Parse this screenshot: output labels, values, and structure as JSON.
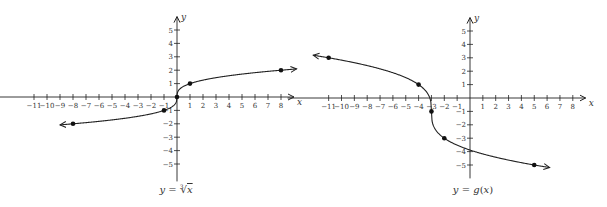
{
  "chart_data": [
    {
      "type": "line",
      "title": "",
      "caption": "y = ∛x",
      "caption_parts": {
        "lhs": "y",
        "eq": " = ",
        "root_index": "3",
        "radicand": "x"
      },
      "xlabel": "x",
      "ylabel": "y",
      "xlim": [
        -11,
        8
      ],
      "ylim": [
        -5,
        5
      ],
      "x_ticks": [
        -11,
        -10,
        -9,
        -8,
        -7,
        -6,
        -5,
        -4,
        -3,
        -2,
        -1,
        1,
        2,
        3,
        4,
        5,
        6,
        7,
        8
      ],
      "x_tick_labels": [
        "−11",
        "−10",
        "−9",
        "−8",
        "−7",
        "−6",
        "−5",
        "−4",
        "−3",
        "−2",
        "−1",
        "1",
        "2",
        "3",
        "4",
        "5",
        "6",
        "7",
        "8"
      ],
      "y_ticks": [
        -5,
        -4,
        -3,
        -2,
        -1,
        1,
        2,
        3,
        4,
        5
      ],
      "y_tick_labels": [
        "−5",
        "−4",
        "−3",
        "−2",
        "−1",
        "1",
        "2",
        "3",
        "4",
        "5"
      ],
      "grid": false,
      "series": [
        {
          "name": "y = ∛x",
          "function": "cbrt(x)",
          "domain_drawn": [
            -9,
            9.2
          ],
          "arrows": "both",
          "points": [
            {
              "x": -8,
              "y": -2
            },
            {
              "x": -1,
              "y": -1
            },
            {
              "x": 0,
              "y": 0
            },
            {
              "x": 1,
              "y": 1
            },
            {
              "x": 8,
              "y": 2
            }
          ]
        }
      ]
    },
    {
      "type": "line",
      "title": "",
      "caption": "y = g(x)",
      "caption_parts": {
        "lhs": "y",
        "eq": " = ",
        "fn": "g",
        "arg": "x"
      },
      "xlabel": "x",
      "ylabel": "y",
      "xlim": [
        -11,
        8
      ],
      "ylim": [
        -5,
        5
      ],
      "x_ticks": [
        -11,
        -10,
        -9,
        -8,
        -7,
        -6,
        -5,
        -4,
        -3,
        -2,
        -1,
        1,
        2,
        3,
        4,
        5,
        6,
        7,
        8
      ],
      "x_tick_labels": [
        "−11",
        "−10",
        "−9",
        "−8",
        "−7",
        "−6",
        "−5",
        "−4",
        "−3",
        "−2",
        "−1",
        "1",
        "2",
        "3",
        "4",
        "5",
        "6",
        "7",
        "8"
      ],
      "y_ticks": [
        -5,
        -4,
        -3,
        -2,
        -1,
        1,
        2,
        3,
        4,
        5
      ],
      "y_tick_labels": [
        "−5",
        "−4",
        "−3",
        "−2",
        "−1",
        "1",
        "2",
        "3",
        "4",
        "5"
      ],
      "grid": false,
      "series": [
        {
          "name": "y = g(x)",
          "function": "-cbrt(x+3) - 1 (shifted/reflected cube root)",
          "domain_drawn": [
            -12.2,
            6.2
          ],
          "arrows": "both",
          "points": [
            {
              "x": -11,
              "y": 3
            },
            {
              "x": -4,
              "y": 1
            },
            {
              "x": -3,
              "y": -1
            },
            {
              "x": -2,
              "y": -3
            },
            {
              "x": 5,
              "y": -5
            }
          ]
        }
      ]
    }
  ]
}
